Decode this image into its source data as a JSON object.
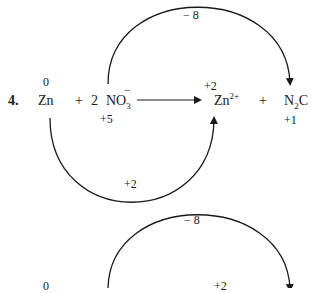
{
  "problem": {
    "number": "4.",
    "species": {
      "zn": {
        "base": "Zn",
        "ox": "0"
      },
      "plus1": "+",
      "coef": "2",
      "nitrate": {
        "base": "NO",
        "sub": "3",
        "sup": "−",
        "ox": "+5"
      },
      "zn2": {
        "base": "Zn",
        "sup": "2+",
        "ox": "+2"
      },
      "plus2": "+",
      "n2o": {
        "base": "N",
        "sub": "2",
        "tail": "C",
        "ox": "+1"
      }
    },
    "arcs": {
      "electron_gain_label": "− 8",
      "electron_loss_label": "+2"
    }
  },
  "repeat": {
    "electron_gain_label": "− 8",
    "zn_ox": "0",
    "zn2_ox": "+2"
  },
  "colors": {
    "ink": "#1a1a1a",
    "background": "#ffffff"
  }
}
